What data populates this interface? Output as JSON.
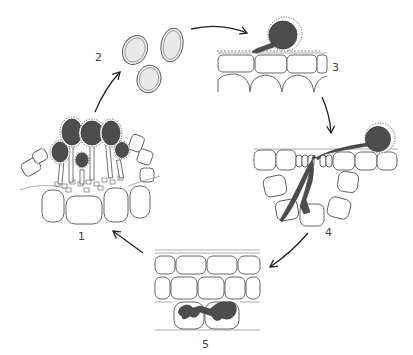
{
  "diagram": {
    "stages": [
      {
        "number": "1",
        "label": "1",
        "description": "sporangia / fruiting bodies erupting from host tissue"
      },
      {
        "number": "2",
        "label": "2",
        "description": "released spores"
      },
      {
        "number": "3",
        "label": "3",
        "description": "spore germinating on leaf surface"
      },
      {
        "number": "4",
        "label": "4",
        "description": "germ tube penetrating host cells"
      },
      {
        "number": "5",
        "label": "5",
        "description": "hyphae colonizing within host cells"
      }
    ],
    "arrows": [
      {
        "from": "1",
        "to": "2"
      },
      {
        "from": "2",
        "to": "3"
      },
      {
        "from": "3",
        "to": "4"
      },
      {
        "from": "4",
        "to": "5"
      },
      {
        "from": "5",
        "to": "1"
      }
    ],
    "colors": {
      "fungus": "#4d4d4d",
      "cell_outline": "#555555",
      "spore_fill": "#e9e9e9",
      "background": "#ffffff"
    }
  }
}
